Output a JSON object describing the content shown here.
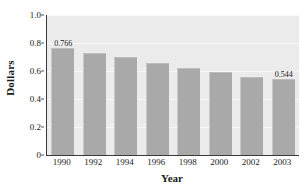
{
  "chart_data": {
    "type": "bar",
    "title": "",
    "xlabel": "Year",
    "ylabel": "Dollars",
    "categories": [
      "1990",
      "1992",
      "1994",
      "1996",
      "1998",
      "2000",
      "2002",
      "2003"
    ],
    "values": [
      0.766,
      0.73,
      0.7,
      0.66,
      0.62,
      0.59,
      0.56,
      0.544
    ],
    "point_labels": [
      "0.766",
      "",
      "",
      "",
      "",
      "",
      "",
      "0.544"
    ],
    "ylim": [
      0,
      1.0
    ],
    "yticks": [
      0,
      0.2,
      0.4,
      0.6,
      0.8,
      1.0
    ],
    "ytick_labels": [
      "0",
      "0.2",
      "0.4",
      "0.6",
      "0.8",
      "1.0"
    ],
    "grid": true,
    "legend": null,
    "bar_color": "#a9a9a9",
    "plot_background": "#ebebeb",
    "axis_color": "#3a3a3a"
  }
}
